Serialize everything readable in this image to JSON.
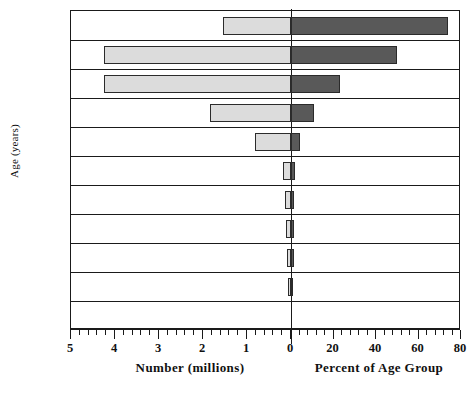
{
  "chart_data": {
    "type": "bar",
    "title": "",
    "subtitle": "",
    "orientation": "horizontal-diverging",
    "ylabel": "Age (years)",
    "categories": [
      "Over 84",
      "75–84",
      "65–74",
      "55–64",
      "45–54",
      "40–44",
      "35–39",
      "30–34",
      "25–29",
      "20–24",
      "18–19"
    ],
    "legend": [],
    "grid": false,
    "series": [
      {
        "name": "Number (millions)",
        "axis": "left",
        "color": "#dcdcdc",
        "xlabel": "Number  (millions)",
        "xlim": [
          5,
          0
        ],
        "ticks_major": [
          5,
          4,
          3,
          2,
          1,
          0
        ],
        "tick_labels": [
          "5",
          "4",
          "3",
          "2",
          "1",
          "0"
        ],
        "minor_per_interval": 4,
        "values": [
          1.55,
          4.25,
          4.25,
          1.85,
          0.82,
          0.18,
          0.14,
          0.12,
          0.1,
          0.02,
          0.0
        ]
      },
      {
        "name": "Percent of Age Group",
        "axis": "right",
        "color": "#595959",
        "xlabel": "Percent  of  Age  Group",
        "xlim": [
          0,
          80
        ],
        "ticks_major": [
          0,
          20,
          40,
          60,
          80
        ],
        "tick_labels": [
          "0",
          "20",
          "40",
          "60",
          "80"
        ],
        "minor_per_interval": 4,
        "values": [
          74,
          50,
          23,
          11,
          4.2,
          2.0,
          1.6,
          1.4,
          1.2,
          0.6,
          0.0
        ]
      }
    ]
  }
}
